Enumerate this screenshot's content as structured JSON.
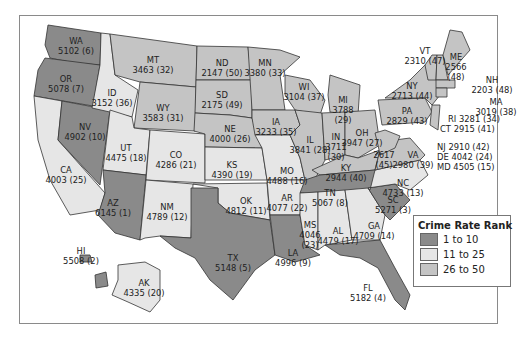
{
  "legend": {
    "title": "Crime Rate Rank",
    "items": [
      {
        "label": "1 to 10",
        "color": "#8a8a8a"
      },
      {
        "label": "11 to 25",
        "color": "#e6e6e6"
      },
      {
        "label": "26 to 50",
        "color": "#c4c4c4"
      }
    ]
  },
  "states": {
    "WA": {
      "abbr": "WA",
      "value": "5102 (6)"
    },
    "OR": {
      "abbr": "OR",
      "value": "5078 (7)"
    },
    "CA": {
      "abbr": "CA",
      "value": "4003 (25)"
    },
    "NV": {
      "abbr": "NV",
      "value": "4902 (10)"
    },
    "ID": {
      "abbr": "ID",
      "value": "3152 (36)"
    },
    "MT": {
      "abbr": "MT",
      "value": "3463 (32)"
    },
    "WY": {
      "abbr": "WY",
      "value": "3583 (31)"
    },
    "UT": {
      "abbr": "UT",
      "value": "4475 (18)"
    },
    "AZ": {
      "abbr": "AZ",
      "value": "6145 (1)"
    },
    "CO": {
      "abbr": "CO",
      "value": "4286 (21)"
    },
    "NM": {
      "abbr": "NM",
      "value": "4789 (12)"
    },
    "ND": {
      "abbr": "ND",
      "value": "2147 (50)"
    },
    "SD": {
      "abbr": "SD",
      "value": "2175 (49)"
    },
    "NE": {
      "abbr": "NE",
      "value": "4000 (26)"
    },
    "KS": {
      "abbr": "KS",
      "value": "4390 (19)"
    },
    "OK": {
      "abbr": "OK",
      "value": "4812 (11)"
    },
    "TX": {
      "abbr": "TX",
      "value": "5148 (5)"
    },
    "MN": {
      "abbr": "MN",
      "value": "3380 (33)"
    },
    "IA": {
      "abbr": "IA",
      "value": "3233 (35)"
    },
    "MO": {
      "abbr": "MO",
      "value": "4488 (16)"
    },
    "AR": {
      "abbr": "AR",
      "value": "4077 (22)"
    },
    "LA": {
      "abbr": "LA",
      "value": "4996 (9)"
    },
    "WI": {
      "abbr": "WI",
      "value": "3104 (37)"
    },
    "IL": {
      "abbr": "IL",
      "value": "3841 (28)"
    },
    "MI": {
      "abbr": "MI",
      "value": "3788",
      "rank": "(29)"
    },
    "IN": {
      "abbr": "IN",
      "value": "3711",
      "rank": "(30)"
    },
    "OH": {
      "abbr": "OH",
      "value": "3947 (27)"
    },
    "KY": {
      "abbr": "KY",
      "value": "2944 (40)"
    },
    "TN": {
      "abbr": "TN",
      "value": "5067 (8)"
    },
    "MS": {
      "abbr": "MS",
      "value": "4046",
      "rank": "(23)"
    },
    "AL": {
      "abbr": "AL",
      "value": "4479 (17)"
    },
    "GA": {
      "abbr": "GA",
      "value": "4709 (14)"
    },
    "FL": {
      "abbr": "FL",
      "value": "5182 (4)"
    },
    "SC": {
      "abbr": "SC",
      "value": "5271 (3)"
    },
    "NC": {
      "abbr": "NC",
      "value": "4733 (13)"
    },
    "VA": {
      "abbr": "VA",
      "value": "2980 (39)"
    },
    "WV": {
      "abbr": "WV",
      "value": "2617",
      "rank": "(45)"
    },
    "PA": {
      "abbr": "PA",
      "value": "2829 (43)"
    },
    "NY": {
      "abbr": "NY",
      "value": "2713 (44)"
    },
    "VT": {
      "abbr": "VT",
      "value": "2310 (47)"
    },
    "NH": {
      "abbr": "NH",
      "value": "2203 (48)"
    },
    "ME": {
      "abbr": "ME",
      "value": "2566",
      "rank": "(48)"
    },
    "MA": {
      "abbr": "MA",
      "value": "3019 (38)"
    },
    "RI": {
      "text": "RI 3281 (34)"
    },
    "CT": {
      "text": "CT 2915 (41)"
    },
    "NJ": {
      "text": "NJ 2910 (42)"
    },
    "DE": {
      "text": "DE 4042 (24)"
    },
    "MD": {
      "text": "MD 4505 (15)"
    },
    "HI": {
      "abbr": "HI",
      "value": "5508 (2)"
    },
    "AK": {
      "abbr": "AK",
      "value": "4335 (20)"
    }
  }
}
